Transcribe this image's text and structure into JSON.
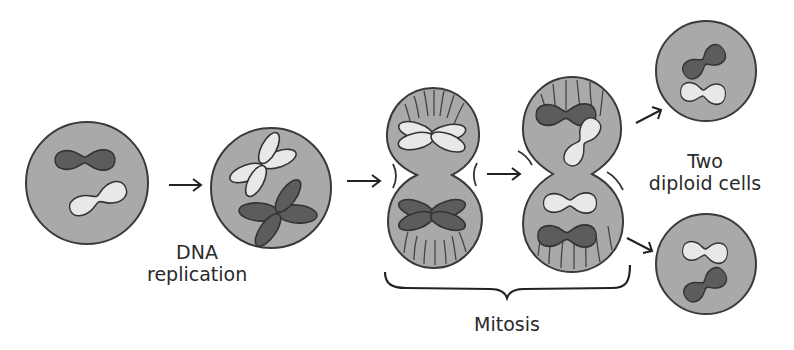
{
  "labels": {
    "dna_line1": "DNA",
    "dna_line2": "replication",
    "mitosis": "Mitosis",
    "result_line1": "Two",
    "result_line2": "diploid cells"
  },
  "stages": [
    {
      "id": "parent-cell",
      "description": "Diploid cell with one dark and one light chromosome"
    },
    {
      "id": "replicated-cell",
      "description": "Cell with duplicated chromosomes (sister chromatids)"
    },
    {
      "id": "mitosis-early",
      "description": "Dividing cell with duplicated chromosomes separating into two lobes"
    },
    {
      "id": "mitosis-late",
      "description": "Dividing cell with separated chromosomes in each lobe"
    },
    {
      "id": "daughter-cell-top",
      "description": "Diploid daughter cell"
    },
    {
      "id": "daughter-cell-bottom",
      "description": "Diploid daughter cell"
    }
  ],
  "colors": {
    "cell_fill": "#a9a9a9",
    "outline": "#3a3a3a",
    "chromosome_dark": "#5c5c5c",
    "chromosome_light": "#e8e8e8",
    "background": "#ffffff"
  }
}
